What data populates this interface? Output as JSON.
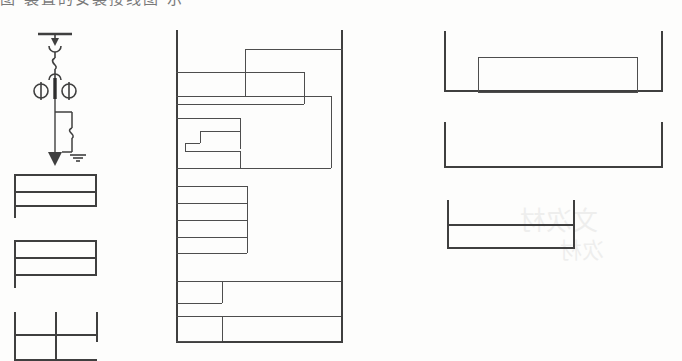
{
  "page": {
    "width": 682,
    "height": 361,
    "background_color": "#fdfdfc",
    "ink_color": "#4d4d4d",
    "clipped_heading_text": "图 装置的安装接线图  示",
    "ghost_text_right": "文次材",
    "ghost_text_lower": "次材"
  },
  "schematic": {
    "title": "single-line-diagram",
    "components": [
      {
        "name": "busbar",
        "label": ""
      },
      {
        "name": "arrow-down-connector",
        "label": ""
      },
      {
        "name": "disconnect-switch-hook",
        "label": ""
      },
      {
        "name": "instrument-transformer-left",
        "label": ""
      },
      {
        "name": "instrument-transformer-right",
        "label": ""
      },
      {
        "name": "surge-arrester-box",
        "label": ""
      },
      {
        "name": "earth-arrow",
        "label": ""
      },
      {
        "name": "earth-ground-symbol",
        "label": ""
      }
    ]
  },
  "left_column": {
    "name": "left-form-stack",
    "blocks": [
      {
        "name": "left-table-upper",
        "rows": 2,
        "columns": 1
      },
      {
        "name": "left-table-middle",
        "rows": 3,
        "columns": 1
      },
      {
        "name": "left-table-lower",
        "rows": 2,
        "columns": 2
      }
    ]
  },
  "middle_column": {
    "name": "middle-form-stack",
    "blocks": [
      {
        "name": "middle-outer-frame",
        "rows": 0,
        "columns": 0
      },
      {
        "name": "middle-top-wide-rect",
        "rows": 1,
        "columns": 1
      },
      {
        "name": "middle-band-a",
        "rows": 1,
        "columns": 1
      },
      {
        "name": "middle-band-b",
        "rows": 1,
        "columns": 1
      },
      {
        "name": "middle-stepped-region",
        "rows": 3,
        "columns": 2
      },
      {
        "name": "middle-row-stack",
        "rows": 4,
        "columns": 1
      },
      {
        "name": "middle-bottom-cell-a",
        "rows": 1,
        "columns": 2
      },
      {
        "name": "middle-bottom-cell-b",
        "rows": 1,
        "columns": 2
      }
    ]
  },
  "right_column": {
    "name": "right-bracket-stack",
    "blocks": [
      {
        "name": "right-bracket-upper",
        "has_inner_rect": true
      },
      {
        "name": "right-bracket-middle",
        "has_inner_rect": false
      },
      {
        "name": "right-bracket-lower",
        "has_inner_rect": true
      }
    ]
  }
}
